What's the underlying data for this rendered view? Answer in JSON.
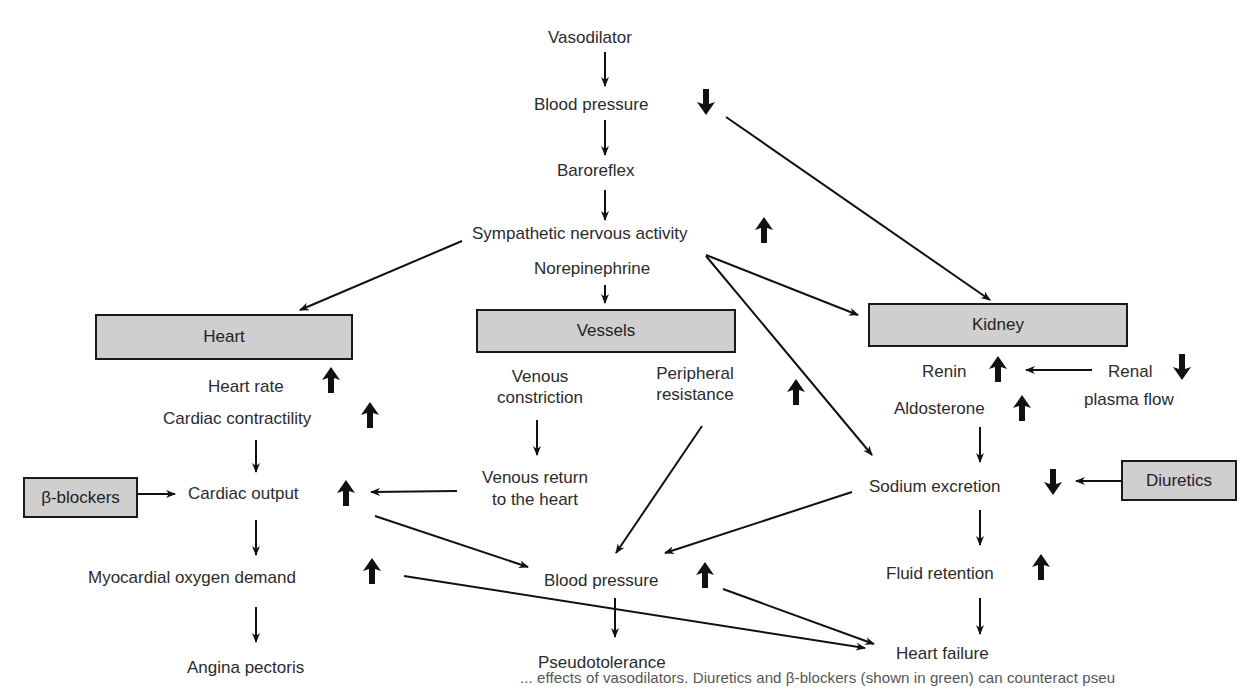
{
  "diagram": {
    "nodes": {
      "vasodilator": "Vasodilator",
      "blood_pressure_top": "Blood pressure",
      "baroreflex": "Baroreflex",
      "sympathetic": "Sympathetic nervous activity",
      "norepinephrine": "Norepinephrine",
      "heart_box": "Heart",
      "vessels_box": "Vessels",
      "kidney_box": "Kidney",
      "heart_rate": "Heart rate",
      "cardiac_contractility": "Cardiac contractility",
      "venous_constriction_1": "Venous",
      "venous_constriction_2": "constriction",
      "peripheral_resistance_1": "Peripheral",
      "peripheral_resistance_2": "resistance",
      "renin": "Renin",
      "renal_1": "Renal",
      "renal_2": "plasma flow",
      "aldosterone": "Aldosterone",
      "beta_blockers_box": "β-blockers",
      "cardiac_output": "Cardiac output",
      "venous_return_1": "Venous return",
      "venous_return_2": "to the heart",
      "sodium_excretion": "Sodium excretion",
      "diuretics_box": "Diuretics",
      "myocardial_oxygen": "Myocardial oxygen demand",
      "blood_pressure_mid": "Blood pressure",
      "fluid_retention": "Fluid retention",
      "angina": "Angina pectoris",
      "pseudotolerance": "Pseudotolerance",
      "heart_failure": "Heart failure"
    },
    "indicators": {
      "blood_pressure_top": "down",
      "sympathetic": "up",
      "heart_rate": "up",
      "cardiac_contractility": "up",
      "peripheral_resistance": "up",
      "renin": "up",
      "renal_plasma_flow": "down",
      "aldosterone": "up",
      "cardiac_output": "up",
      "sodium_excretion": "down",
      "myocardial_oxygen": "up",
      "blood_pressure_mid": "up",
      "fluid_retention": "up"
    },
    "colors": {
      "box_fill": "#cfcfcf",
      "box_border": "#1a1a1a",
      "line": "#111111",
      "text": "#2b2b2b"
    }
  },
  "caption": "... effects of vasodilators. Diuretics and β-blockers (shown in green) can counteract pseu"
}
